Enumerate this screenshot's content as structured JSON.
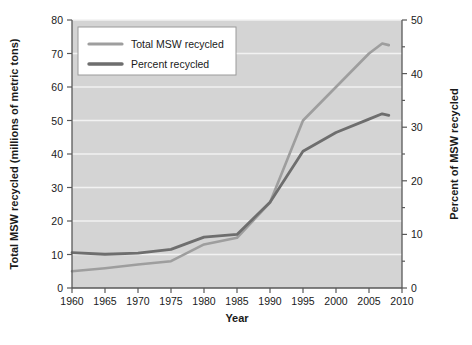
{
  "chart_data": {
    "type": "line",
    "title": "",
    "xlabel": "Year",
    "ylabel_left": "Total MSW recycled (millions of metric tons)",
    "ylabel_right": "Percent of MSW recycled",
    "xlim": [
      1960,
      2010
    ],
    "ylim_left": [
      0,
      80
    ],
    "ylim_right": [
      0,
      50
    ],
    "xticks": [
      1960,
      1965,
      1970,
      1975,
      1980,
      1985,
      1990,
      1995,
      2000,
      2005,
      2010
    ],
    "xtick_labels": [
      "1960",
      "1965",
      "1970",
      "1975",
      "1980",
      "1985",
      "1990",
      "1995",
      "2000",
      "2005",
      "2010"
    ],
    "yticks_left": [
      0,
      10,
      20,
      30,
      40,
      50,
      60,
      70,
      80
    ],
    "ytick_labels_left": [
      "0",
      "10",
      "20",
      "30",
      "40",
      "50",
      "60",
      "70",
      "80"
    ],
    "yticks_right": [
      0,
      10,
      20,
      30,
      40,
      50
    ],
    "ytick_labels_right": [
      "0",
      "10",
      "20",
      "30",
      "40",
      "50"
    ],
    "grid": true,
    "grid_axis": "y",
    "legend_position": "top-left",
    "plot_background": "#d4d4d4",
    "series": [
      {
        "name": "Total MSW recycled",
        "axis": "left",
        "color": "#9e9e9e",
        "width": 2.6,
        "x": [
          1960,
          1965,
          1970,
          1975,
          1980,
          1985,
          1990,
          1995,
          2000,
          2005,
          2007,
          2008
        ],
        "values": [
          5.0,
          5.9,
          7.0,
          8.0,
          13.0,
          15.0,
          25.5,
          50.0,
          60.0,
          70.0,
          73.0,
          72.5
        ]
      },
      {
        "name": "Percent recycled",
        "axis": "right",
        "color": "#6e6e6e",
        "width": 2.8,
        "x": [
          1960,
          1965,
          1970,
          1975,
          1980,
          1985,
          1990,
          1995,
          2000,
          2005,
          2007,
          2008
        ],
        "values": [
          6.6,
          6.3,
          6.5,
          7.2,
          9.5,
          10.0,
          16.0,
          25.5,
          29.0,
          31.5,
          32.5,
          32.2
        ]
      }
    ]
  },
  "legend": {
    "items": [
      {
        "label": "Total MSW recycled",
        "color": "#9e9e9e"
      },
      {
        "label": "Percent recycled",
        "color": "#6e6e6e"
      }
    ]
  },
  "axes": {
    "x_title": "Year",
    "y_left_title": "Total MSW recycled (millions of metric tons)",
    "y_right_title": "Percent of MSW recycled"
  }
}
